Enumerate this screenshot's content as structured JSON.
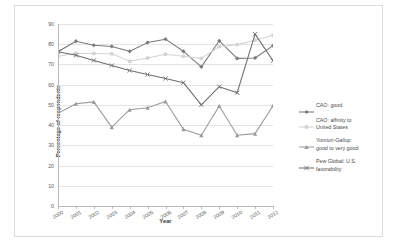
{
  "chart_data": {
    "type": "line",
    "title": "",
    "xlabel": "Year",
    "ylabel": "Percentage of respondents",
    "x": [
      2000,
      2001,
      2002,
      2003,
      2004,
      2005,
      2006,
      2007,
      2008,
      2009,
      2010,
      2011,
      2012
    ],
    "xticklabels": [
      "2000",
      "2001",
      "2002",
      "2003",
      "2004",
      "2005",
      "2006",
      "2007",
      "2008",
      "2009",
      "2010",
      "2011",
      "2012"
    ],
    "yticklabels": [
      "0",
      "10",
      "20",
      "30",
      "40",
      "50",
      "60",
      "70",
      "80",
      "90"
    ],
    "yticks": [
      0,
      10,
      20,
      30,
      40,
      50,
      60,
      70,
      80,
      90
    ],
    "ylim": [
      0,
      90
    ],
    "grid": "horizontal",
    "legend_position": "right",
    "series": [
      {
        "name": "CAO: good",
        "color": "#7a7a7a",
        "marker": "diamond",
        "values": [
          76.3,
          81.5,
          79.5,
          78.9,
          76.5,
          80.8,
          82.5,
          76.5,
          68.8,
          81.7,
          73.0,
          73.2,
          79.3
        ]
      },
      {
        "name": "CAO: affinity to United States",
        "color": "#d4d4d4",
        "marker": "circle",
        "values": [
          74.0,
          75.5,
          75.4,
          75.3,
          71.6,
          73.2,
          75.0,
          74.1,
          73.0,
          78.9,
          79.8,
          82.0,
          84.4
        ]
      },
      {
        "name": "Yomiuri-Gallup: good to very good",
        "color": "#9a9a9a",
        "marker": "triangle",
        "values": [
          45.8,
          50.6,
          51.5,
          39.0,
          47.6,
          48.6,
          51.7,
          38.0,
          35.0,
          49.5,
          35.0,
          35.8,
          49.6
        ]
      },
      {
        "name": "Pew Global: U.S. favorability",
        "color": "#6e6e6e",
        "marker": "x",
        "values": [
          76.3,
          74.5,
          72.0,
          69.5,
          67.0,
          65.0,
          63.0,
          61.0,
          50.0,
          59.0,
          56.0,
          85.0,
          71.8
        ]
      }
    ]
  },
  "legend": {
    "items": [
      {
        "label": "CAO: good"
      },
      {
        "label": "CAO: affinity to\nUnited States"
      },
      {
        "label": "Yomiuri-Gallup:\ngood to very good"
      },
      {
        "label": "Pew Global: U.S.\nfavorability"
      }
    ]
  }
}
